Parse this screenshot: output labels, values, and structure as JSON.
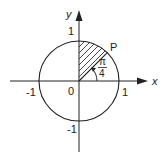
{
  "diagram": {
    "axes": {
      "x_label": "x",
      "y_label": "y"
    },
    "ticks": {
      "x_neg": "-1",
      "x_pos": "1",
      "y_pos": "1",
      "y_neg": "-1",
      "origin": "0"
    },
    "point_label": "P",
    "angle": {
      "numerator": "π",
      "denominator": "4"
    },
    "shaded_region": "sector between angle π/4 and π/2 of the unit circle",
    "colors": {
      "stroke": "#222222",
      "background": "#ffffff"
    }
  }
}
